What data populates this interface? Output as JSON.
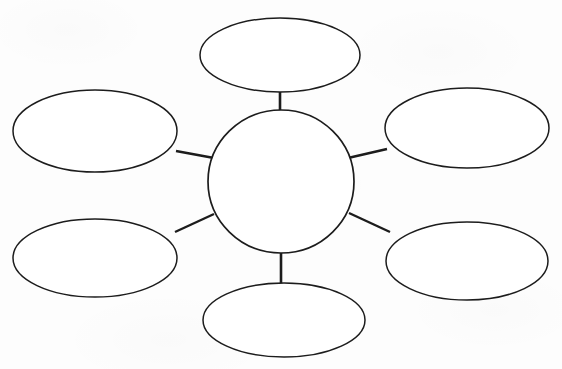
{
  "document": {
    "title": "Concept Map Worksheet",
    "type": "blank-graphic-organizer",
    "background_color": "#fdfdfd",
    "ink_color": "#1c1c1c"
  },
  "diagram": {
    "name": "spider-concept-map",
    "center": {
      "id": "center-node",
      "shape": "circle",
      "label": "",
      "cx": 281,
      "cy": 181.5,
      "rx": 73,
      "ry": 71.5,
      "stroke_width": 1.7
    },
    "branches": [
      {
        "id": "branch-top",
        "position": "top",
        "shape": "ellipse",
        "label": "",
        "cx": 280,
        "cy": 55,
        "rx": 80,
        "ry": 37,
        "stroke_width": 1.5
      },
      {
        "id": "branch-top-left",
        "position": "top-left",
        "shape": "ellipse",
        "label": "",
        "cx": 95,
        "cy": 131,
        "rx": 82,
        "ry": 41,
        "stroke_width": 1.5
      },
      {
        "id": "branch-top-right",
        "position": "top-right",
        "shape": "ellipse",
        "label": "",
        "cx": 467,
        "cy": 128,
        "rx": 82,
        "ry": 40,
        "stroke_width": 1.5
      },
      {
        "id": "branch-bottom-left",
        "position": "bottom-left",
        "shape": "ellipse",
        "label": "",
        "cx": 95,
        "cy": 258,
        "rx": 82,
        "ry": 39,
        "stroke_width": 1.5
      },
      {
        "id": "branch-bottom-right",
        "position": "bottom-right",
        "shape": "ellipse",
        "label": "",
        "cx": 467,
        "cy": 261,
        "rx": 81,
        "ry": 39,
        "stroke_width": 1.5
      },
      {
        "id": "branch-bottom",
        "position": "bottom",
        "shape": "ellipse",
        "label": "",
        "cx": 284,
        "cy": 320,
        "rx": 81,
        "ry": 37,
        "stroke_width": 1.5
      }
    ],
    "connectors": [
      {
        "id": "connector-top",
        "from": "center-node",
        "to": "branch-top",
        "x1": 280,
        "y1": 111,
        "x2": 280,
        "y2": 92,
        "stroke_width": 2.6
      },
      {
        "id": "connector-top-left",
        "from": "center-node",
        "to": "branch-top-left",
        "x1": 214,
        "y1": 158,
        "x2": 176,
        "y2": 151,
        "stroke_width": 2.4
      },
      {
        "id": "connector-top-right",
        "from": "center-node",
        "to": "branch-top-right",
        "x1": 348,
        "y1": 158,
        "x2": 387,
        "y2": 149,
        "stroke_width": 2.4
      },
      {
        "id": "connector-bottom-left",
        "from": "center-node",
        "to": "branch-bottom-left",
        "x1": 214,
        "y1": 214,
        "x2": 175,
        "y2": 232,
        "stroke_width": 2.4
      },
      {
        "id": "connector-bottom-right",
        "from": "center-node",
        "to": "branch-bottom-right",
        "x1": 349,
        "y1": 213,
        "x2": 390,
        "y2": 232,
        "stroke_width": 2.4
      },
      {
        "id": "connector-bottom",
        "from": "center-node",
        "to": "branch-bottom",
        "x1": 281,
        "y1": 253,
        "x2": 281,
        "y2": 284,
        "stroke_width": 2.6
      }
    ]
  }
}
